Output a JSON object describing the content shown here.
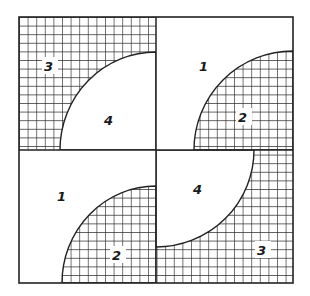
{
  "diagram": {
    "colors": {
      "line": "#222222",
      "background": "#ffffff",
      "grid": "#2a2a2a"
    },
    "outer": {
      "x": 19,
      "y": 17,
      "width": 274,
      "height": 266
    },
    "center": {
      "x": 156,
      "y": 150
    },
    "grid_cell": 8.6,
    "quadrants": [
      {
        "id": "top-left",
        "background": "checked",
        "arc": "plain",
        "arc_corner": "bottom-right",
        "labels": {
          "background": "3",
          "arc": "4"
        }
      },
      {
        "id": "top-right",
        "background": "plain",
        "arc": "checked",
        "arc_corner": "bottom-right",
        "labels": {
          "background": "1",
          "arc": "2"
        }
      },
      {
        "id": "bottom-left",
        "background": "plain",
        "arc": "checked",
        "arc_corner": "bottom-right",
        "labels": {
          "background": "1",
          "arc": "2"
        }
      },
      {
        "id": "bottom-right",
        "background": "checked",
        "arc": "plain",
        "arc_corner": "top-left",
        "labels": {
          "background": "3",
          "arc": "4"
        }
      }
    ],
    "labels": [
      {
        "text": "3",
        "x": 49,
        "y": 70
      },
      {
        "text": "4",
        "x": 109,
        "y": 124
      },
      {
        "text": "1",
        "x": 202,
        "y": 70
      },
      {
        "text": "2",
        "x": 243,
        "y": 121
      },
      {
        "text": "1",
        "x": 61,
        "y": 200
      },
      {
        "text": "2",
        "x": 117,
        "y": 259
      },
      {
        "text": "4",
        "x": 197,
        "y": 193
      },
      {
        "text": "3",
        "x": 262,
        "y": 254
      }
    ]
  }
}
